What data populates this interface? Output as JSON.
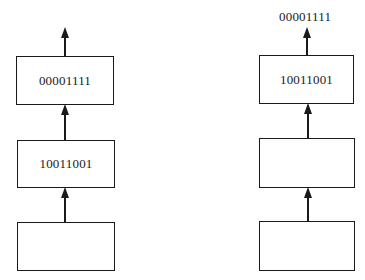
{
  "diagram": {
    "left_stack": {
      "boxes": [
        {
          "label": "00001111"
        },
        {
          "label": "10011001"
        },
        {
          "label": ""
        }
      ],
      "output_label": ""
    },
    "right_stack": {
      "boxes": [
        {
          "label": "10011001"
        },
        {
          "label": ""
        },
        {
          "label": ""
        }
      ],
      "output_label": "00001111"
    },
    "caption": ""
  },
  "colors": {
    "stroke": "#1a1a1a",
    "background": "#ffffff"
  }
}
